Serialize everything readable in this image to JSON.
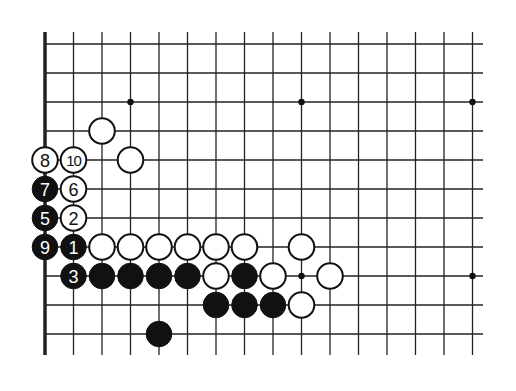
{
  "diagram": {
    "type": "go-board-fragment",
    "grid": {
      "x0": 45,
      "dx": 28.5,
      "cols": 16,
      "y0": 44,
      "dy": 29,
      "rows": 11,
      "line_top": 32,
      "line_bottom": 355,
      "line_right": 483,
      "edge": "left"
    },
    "colors": {
      "black": "#111111",
      "white": "#ffffff",
      "line": "#222222"
    },
    "star_points": [
      [
        3,
        2
      ],
      [
        9,
        2
      ],
      [
        15,
        2
      ],
      [
        9,
        8
      ],
      [
        15,
        8
      ]
    ],
    "stones": [
      {
        "c": 2,
        "r": 3,
        "color": "white",
        "label": ""
      },
      {
        "c": 0,
        "r": 4,
        "color": "white",
        "label": "8"
      },
      {
        "c": 1,
        "r": 4,
        "color": "white",
        "label": "10"
      },
      {
        "c": 3,
        "r": 4,
        "color": "white",
        "label": ""
      },
      {
        "c": 0,
        "r": 5,
        "color": "black",
        "label": "7"
      },
      {
        "c": 1,
        "r": 5,
        "color": "white",
        "label": "6"
      },
      {
        "c": 0,
        "r": 6,
        "color": "black",
        "label": "5"
      },
      {
        "c": 1,
        "r": 6,
        "color": "white",
        "label": "2"
      },
      {
        "c": 0,
        "r": 7,
        "color": "black",
        "label": "9"
      },
      {
        "c": 1,
        "r": 7,
        "color": "black",
        "label": "1"
      },
      {
        "c": 2,
        "r": 7,
        "color": "white",
        "label": ""
      },
      {
        "c": 3,
        "r": 7,
        "color": "white",
        "label": ""
      },
      {
        "c": 4,
        "r": 7,
        "color": "white",
        "label": ""
      },
      {
        "c": 5,
        "r": 7,
        "color": "white",
        "label": ""
      },
      {
        "c": 6,
        "r": 7,
        "color": "white",
        "label": ""
      },
      {
        "c": 7,
        "r": 7,
        "color": "white",
        "label": ""
      },
      {
        "c": 9,
        "r": 7,
        "color": "white",
        "label": ""
      },
      {
        "c": 1,
        "r": 8,
        "color": "black",
        "label": "3"
      },
      {
        "c": 2,
        "r": 8,
        "color": "black",
        "label": ""
      },
      {
        "c": 3,
        "r": 8,
        "color": "black",
        "label": ""
      },
      {
        "c": 4,
        "r": 8,
        "color": "black",
        "label": ""
      },
      {
        "c": 5,
        "r": 8,
        "color": "black",
        "label": ""
      },
      {
        "c": 6,
        "r": 8,
        "color": "white",
        "label": ""
      },
      {
        "c": 7,
        "r": 8,
        "color": "black",
        "label": ""
      },
      {
        "c": 8,
        "r": 8,
        "color": "white",
        "label": ""
      },
      {
        "c": 10,
        "r": 8,
        "color": "white",
        "label": ""
      },
      {
        "c": 6,
        "r": 9,
        "color": "black",
        "label": ""
      },
      {
        "c": 7,
        "r": 9,
        "color": "black",
        "label": ""
      },
      {
        "c": 8,
        "r": 9,
        "color": "black",
        "label": ""
      },
      {
        "c": 9,
        "r": 9,
        "color": "white",
        "label": ""
      },
      {
        "c": 4,
        "r": 10,
        "color": "black",
        "label": ""
      }
    ]
  }
}
